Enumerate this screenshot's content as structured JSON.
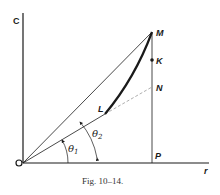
{
  "figure": {
    "caption": "Fig. 10–14.",
    "axes": {
      "vertical_label": "C",
      "horizontal_label": "r",
      "origin_label": "O"
    },
    "points": {
      "M": "M",
      "K": "K",
      "N": "N",
      "L": "L",
      "P": "P"
    },
    "angles": {
      "theta1": {
        "symbol": "θ",
        "subscript": "1"
      },
      "theta2": {
        "symbol": "θ",
        "subscript": "2"
      }
    },
    "colors": {
      "ink": "#1a1a1a",
      "dashed": "#9a9a9a"
    }
  }
}
